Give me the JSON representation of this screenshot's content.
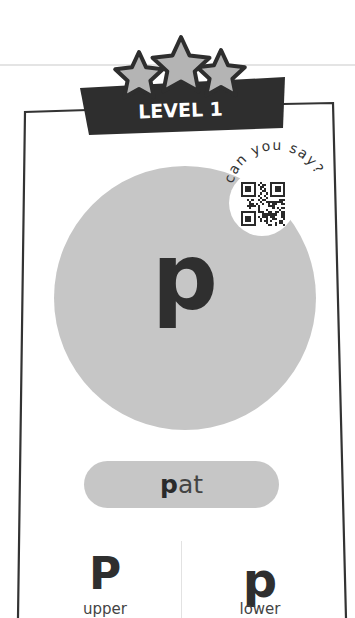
{
  "card": {
    "level_label": "LEVEL 1",
    "stars_count": 3,
    "letter": "p",
    "badge": {
      "caption": "can you say?",
      "icon": "qr-code-icon"
    },
    "word": {
      "highlight": "p",
      "rest": "at",
      "full": "pat"
    },
    "cases": [
      {
        "glyph": "P",
        "label": "upper"
      },
      {
        "glyph": "p",
        "label": "lower"
      }
    ]
  },
  "colors": {
    "circle_fill": "#c6c6c6",
    "banner_fill": "#2e2e2e",
    "star_fill": "#b4b4b4",
    "ink": "#2f2f2f"
  }
}
